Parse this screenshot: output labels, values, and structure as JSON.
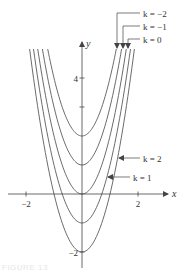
{
  "chart_data": {
    "type": "line",
    "title": "",
    "function": "y = 2x^2 + k",
    "xlabel": "x",
    "ylabel": "y",
    "xlim": [
      -2.8,
      3.1
    ],
    "ylim": [
      -2.6,
      5.0
    ],
    "x_ticks": [
      {
        "value": -2,
        "label": "−2"
      },
      {
        "value": 2,
        "label": "2"
      }
    ],
    "y_ticks": [
      {
        "value": 4,
        "label": "4"
      },
      {
        "value": 3,
        "label": ""
      },
      {
        "value": -2,
        "label": "−2"
      }
    ],
    "grid": false,
    "series": [
      {
        "name": "k = −2",
        "k": -2,
        "vertex": [
          0,
          -2
        ]
      },
      {
        "name": "k = −1",
        "k": -1,
        "vertex": [
          0,
          -1
        ]
      },
      {
        "name": "k = 0",
        "k": 0,
        "vertex": [
          0,
          0
        ]
      },
      {
        "name": "k = 1",
        "k": 1,
        "vertex": [
          0,
          1
        ]
      },
      {
        "name": "k = 2",
        "k": 2,
        "vertex": [
          0,
          2
        ]
      }
    ],
    "annotations": [
      {
        "label": "k = −2",
        "points_to": "k=-2 right branch top",
        "position": "top-right"
      },
      {
        "label": "k = −1",
        "points_to": "k=-1 right branch top",
        "position": "top-right"
      },
      {
        "label": "k = 0",
        "points_to": "k=0 right branch top",
        "position": "top-right"
      },
      {
        "label": "k = 2",
        "points_to": "k=2 right branch",
        "position": "right"
      },
      {
        "label": "k = 1",
        "points_to": "k=1 right branch",
        "position": "right"
      }
    ]
  },
  "colors": {
    "curve": "#5a5a5a",
    "axis": "#444444",
    "text": "#333333"
  },
  "caption": "FIGURE 13"
}
